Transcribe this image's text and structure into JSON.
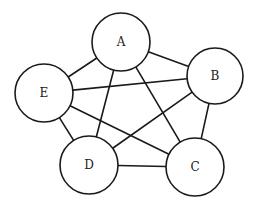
{
  "diagram": {
    "type": "complete-graph",
    "title": "",
    "nodes": [
      {
        "id": "A",
        "label": "A",
        "x": 121,
        "y": 42,
        "r": 29
      },
      {
        "id": "B",
        "label": "B",
        "x": 215,
        "y": 76,
        "r": 28
      },
      {
        "id": "C",
        "label": "C",
        "x": 195,
        "y": 167,
        "r": 29
      },
      {
        "id": "D",
        "label": "D",
        "x": 89,
        "y": 165,
        "r": 29
      },
      {
        "id": "E",
        "label": "E",
        "x": 44,
        "y": 93,
        "r": 29
      }
    ],
    "edges": [
      {
        "from": "A",
        "to": "B"
      },
      {
        "from": "A",
        "to": "C"
      },
      {
        "from": "A",
        "to": "D"
      },
      {
        "from": "A",
        "to": "E"
      },
      {
        "from": "B",
        "to": "C"
      },
      {
        "from": "B",
        "to": "D"
      },
      {
        "from": "B",
        "to": "E"
      },
      {
        "from": "C",
        "to": "D"
      },
      {
        "from": "C",
        "to": "E"
      },
      {
        "from": "D",
        "to": "E"
      }
    ],
    "colors": {
      "stroke": "#1a1a1a",
      "background": "#ffffff",
      "text": "#222222"
    }
  }
}
